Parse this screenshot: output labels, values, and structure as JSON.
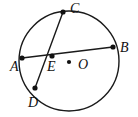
{
  "figure": {
    "kind": "circle-with-chords",
    "width": 138,
    "height": 117,
    "background_color": "#ffffff",
    "stroke_color": "#1a1a1a",
    "label_color": "#111111",
    "circle": {
      "name": "main-circle",
      "center_x": 69,
      "center_y": 61,
      "radius": 50,
      "stroke_width": 1.4
    },
    "center_marker": {
      "name": "circle-center-dot",
      "x": 69,
      "y": 62,
      "radius": 2.1,
      "label": "O"
    },
    "intersection_point": {
      "name": "chord-intersection-E",
      "x": 52,
      "y": 56,
      "radius": 2.6,
      "label": "E"
    },
    "points": [
      {
        "label": "A",
        "x": 22,
        "y": 58,
        "dot_radius": 2.6,
        "on_circle": true
      },
      {
        "label": "B",
        "x": 113,
        "y": 47,
        "dot_radius": 2.6,
        "on_circle": true
      },
      {
        "label": "C",
        "x": 63,
        "y": 12,
        "dot_radius": 2.6,
        "on_circle": true
      },
      {
        "label": "D",
        "x": 35,
        "y": 88,
        "dot_radius": 2.6,
        "on_circle": true
      },
      {
        "label": "E",
        "x": 52,
        "y": 56,
        "dot_radius": 2.6,
        "on_circle": false
      },
      {
        "label": "O",
        "x": 69,
        "y": 62,
        "dot_radius": 2.1,
        "on_circle": false
      }
    ],
    "chords": [
      {
        "name": "chord-AB",
        "from": "A",
        "to": "B",
        "x1": 22,
        "y1": 58,
        "x2": 113,
        "y2": 47,
        "stroke_width": 1.4
      },
      {
        "name": "chord-CD",
        "from": "C",
        "to": "D",
        "x1": 63,
        "y1": 12,
        "x2": 35,
        "y2": 88,
        "stroke_width": 1.4
      }
    ],
    "labels": {
      "a": "A",
      "b": "B",
      "c": "C",
      "d": "D",
      "e": "E",
      "o": "O"
    }
  }
}
